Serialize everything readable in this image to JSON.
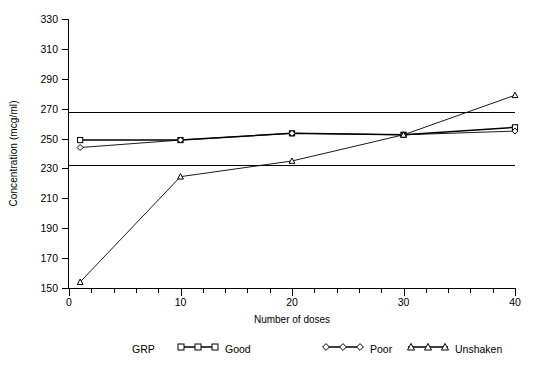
{
  "chart_data": {
    "type": "line",
    "title": "",
    "xlabel": "Number of doses",
    "ylabel": "Concentration (mcg/ml)",
    "x": [
      1,
      10,
      20,
      30,
      40
    ],
    "xlim": [
      0,
      40
    ],
    "ylim": [
      150,
      330
    ],
    "ytick_step": 20,
    "yticks": [
      150,
      170,
      190,
      210,
      230,
      250,
      270,
      290,
      310,
      330
    ],
    "xticks": [
      0,
      10,
      20,
      30,
      40
    ],
    "xtick_labels": [
      "0",
      "10",
      "20",
      "30",
      "40"
    ],
    "xminor_step": 2,
    "grid": false,
    "legend_position": "bottom",
    "legend_title": "GRP",
    "reference_lines": [
      {
        "value": 267.5,
        "label": ""
      },
      {
        "value": 232.5,
        "label": ""
      }
    ],
    "series": [
      {
        "name": "Good",
        "marker": "square",
        "values": [
          249.0,
          249.0,
          253.5,
          252.5,
          257.5
        ]
      },
      {
        "name": "Poor",
        "marker": "diamond",
        "values": [
          244.0,
          249.0,
          253.5,
          252.5,
          255.0
        ]
      },
      {
        "name": "Unshaken",
        "marker": "triangle",
        "values": [
          154.0,
          224.5,
          235.0,
          252.5,
          279.0
        ]
      }
    ]
  },
  "colors": {
    "axis": "#000000",
    "series_good": "#000000",
    "series_poor": "#000000",
    "series_unshaken": "#000000",
    "background": "#ffffff"
  }
}
